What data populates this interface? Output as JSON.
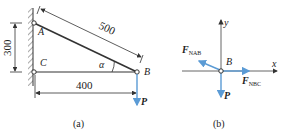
{
  "figure_a": {
    "caption": "(a)",
    "points": {
      "A": "A",
      "B": "B",
      "C": "C"
    },
    "dimensions": {
      "ab_length": "500",
      "ac_height": "300",
      "cb_length": "400"
    },
    "angle_label": "α",
    "load_label": "P"
  },
  "figure_b": {
    "caption": "(b)",
    "point_label": "B",
    "x_axis": "x",
    "y_axis": "y",
    "force_ab": {
      "main": "F",
      "sub": "NAB"
    },
    "force_bc": {
      "main": "F",
      "sub": "NBC"
    },
    "load_label": "P"
  },
  "colors": {
    "force": "#5b9bd5",
    "line": "#333333"
  }
}
